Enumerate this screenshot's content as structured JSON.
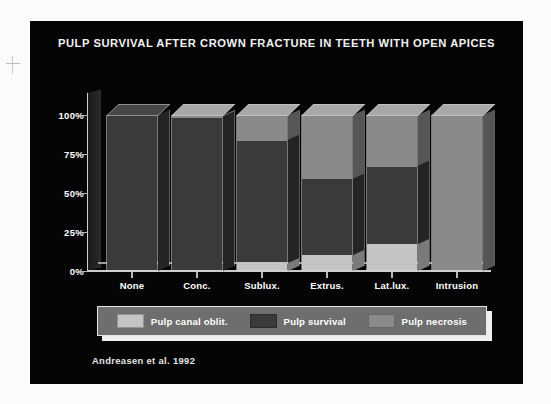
{
  "slide": {
    "title": "PULP SURVIVAL AFTER CROWN FRACTURE IN TEETH WITH OPEN APICES",
    "citation": "Andreasen et al. 1992",
    "background_color": "#050505"
  },
  "legend": {
    "items": [
      {
        "label": "Pulp canal oblit.",
        "color": "#c4c4c4"
      },
      {
        "label": "Pulp survival",
        "color": "#3a3a3a"
      },
      {
        "label": "Pulp necrosis",
        "color": "#8a8a8a"
      }
    ]
  },
  "chart_data": {
    "type": "bar",
    "subtype": "stacked-100-percent-3d",
    "title": "PULP SURVIVAL AFTER CROWN FRACTURE IN TEETH WITH OPEN APICES",
    "xlabel": "",
    "ylabel": "",
    "categories": [
      "None",
      "Conc.",
      "Sublux.",
      "Extrus.",
      "Lat.lux.",
      "Intrusion"
    ],
    "ytick_labels": [
      "0%",
      "25%",
      "50%",
      "75%",
      "100%"
    ],
    "ytick_values": [
      0,
      25,
      50,
      75,
      100
    ],
    "ylim": [
      0,
      100
    ],
    "grid": false,
    "legend_position": "bottom",
    "annotations": [
      "Andreasen et al. 1992"
    ],
    "series": [
      {
        "name": "Pulp canal oblit.",
        "color": "#c4c4c4",
        "values": [
          0,
          0,
          5,
          10,
          17,
          0
        ]
      },
      {
        "name": "Pulp survival",
        "color": "#3a3a3a",
        "values": [
          100,
          99,
          79,
          49,
          50,
          0
        ]
      },
      {
        "name": "Pulp necrosis",
        "color": "#8a8a8a",
        "values": [
          0,
          1,
          16,
          41,
          33,
          100
        ]
      }
    ]
  }
}
